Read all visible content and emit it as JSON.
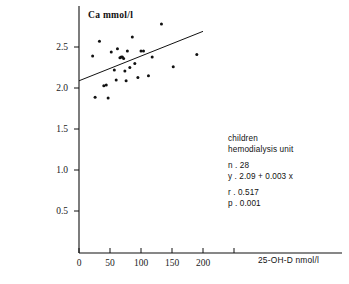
{
  "chart_data": {
    "type": "scatter",
    "title": "",
    "xlabel": "25-OH-D  nmol/l",
    "ylabel": "Ca  mmol/l",
    "xlim": [
      0,
      230
    ],
    "ylim": [
      0,
      2.85
    ],
    "xticks": [
      0,
      50,
      100,
      150,
      200
    ],
    "xticklabels": [
      "0",
      "50",
      "100",
      "150",
      "200"
    ],
    "yticks": [
      0.5,
      1.0,
      1.5,
      2.0,
      2.5
    ],
    "yticklabels": [
      "0.5",
      "1.0",
      "1.5",
      "2.0",
      "2.5"
    ],
    "grid": false,
    "legend": null,
    "x": [
      22,
      26,
      33,
      40,
      44,
      47,
      52,
      57,
      60,
      62,
      66,
      68,
      70,
      72,
      74,
      76,
      78,
      82,
      86,
      90,
      95,
      100,
      104,
      112,
      118,
      133,
      152,
      190
    ],
    "y": [
      2.39,
      1.89,
      2.57,
      2.03,
      2.04,
      1.88,
      2.44,
      2.22,
      2.1,
      2.48,
      2.37,
      2.38,
      2.38,
      2.36,
      2.21,
      2.09,
      2.45,
      2.25,
      2.62,
      2.3,
      2.13,
      2.45,
      2.45,
      2.15,
      2.38,
      2.78,
      2.26,
      2.41
    ],
    "n_points": 28,
    "fit_line": {
      "equation": "y = 2.09 + 0.003 x",
      "intercept": 2.09,
      "slope": 0.003,
      "x_start": 0,
      "x_end": 200
    },
    "annotation": {
      "group_line1": "children",
      "group_line2": "hemodialysis unit",
      "n_label": "n . 28",
      "equation_label": "y .  2.09   +   0.003  x",
      "r_label": "r . 0.517",
      "p_label": "p . 0.001"
    }
  }
}
